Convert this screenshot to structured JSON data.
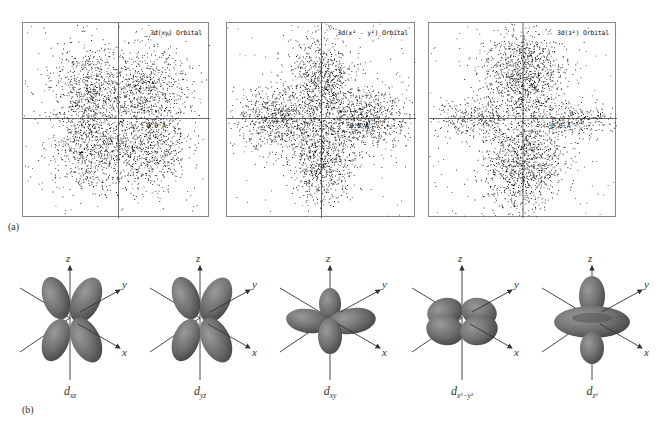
{
  "figure": {
    "part_a_label": "(a)",
    "part_b_label": "(b)",
    "scatter_panels": [
      {
        "id": "dxy",
        "title": "3d(xy) Orbital",
        "scale_label": "0.0 Å",
        "lobes": "diagonal",
        "x": 22,
        "y": 22,
        "w": 187,
        "h": 195
      },
      {
        "id": "dx2y2",
        "title": "3d(x² - y²) Orbital",
        "scale_label": "0.0 Å",
        "lobes": "axial",
        "x": 226,
        "y": 22,
        "w": 189,
        "h": 195
      },
      {
        "id": "dz2",
        "title": "3d(z²) Orbital",
        "scale_label": "0.0 Å",
        "lobes": "z2",
        "x": 428,
        "y": 22,
        "w": 188,
        "h": 195
      }
    ],
    "orbital_models": [
      {
        "id": "dxz",
        "label_main": "d",
        "label_sub": "xz",
        "cx": 70,
        "shape": "cross"
      },
      {
        "id": "dyz",
        "label_main": "d",
        "label_sub": "yz",
        "cx": 200,
        "shape": "cross"
      },
      {
        "id": "dxy",
        "label_main": "d",
        "label_sub": "xy",
        "cx": 330,
        "shape": "flat"
      },
      {
        "id": "dx2y2",
        "label_main": "d",
        "label_sub": "x²−y²",
        "cx": 462,
        "shape": "flat-diag"
      },
      {
        "id": "dz2",
        "label_main": "d",
        "label_sub": "z²",
        "cx": 592,
        "shape": "torus"
      }
    ],
    "axis_labels": {
      "x": "x",
      "y": "y",
      "z": "z"
    }
  },
  "colors": {
    "lobe": "#6f6f6f",
    "lobe_light": "#9a9a9a",
    "lobe_dark": "#4a4a4a",
    "axis": "#333333",
    "dots": "#111111",
    "frame": "#888888"
  }
}
